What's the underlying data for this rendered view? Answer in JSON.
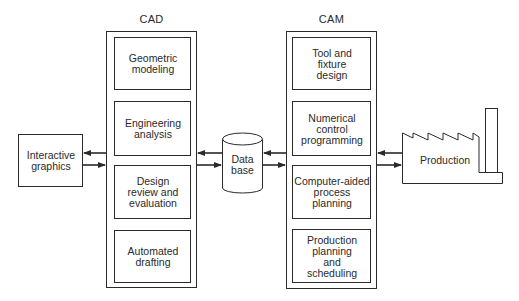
{
  "diagram": {
    "cad": {
      "title": "CAD",
      "modules": [
        {
          "label": "Geometric\nmodeling"
        },
        {
          "label": "Engineering\nanalysis"
        },
        {
          "label": "Design\nreview and\nevaluation"
        },
        {
          "label": "Automated\ndrafting"
        }
      ]
    },
    "cam": {
      "title": "CAM",
      "modules": [
        {
          "label": "Tool and\nfixture\ndesign"
        },
        {
          "label": "Numerical\ncontrol\nprogramming"
        },
        {
          "label": "Computer-aided\nprocess\nplanning"
        },
        {
          "label": "Production\nplanning\nand\nscheduling"
        }
      ]
    },
    "interactive_graphics": {
      "label": "Interactive\ngraphics"
    },
    "database": {
      "label": "Data\nbase"
    },
    "production": {
      "label": "Production"
    },
    "colors": {
      "stroke": "#2a2a2a",
      "background": "#ffffff"
    }
  }
}
